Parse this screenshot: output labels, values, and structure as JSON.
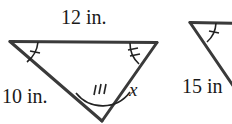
{
  "figure": {
    "stroke_color": "#333333",
    "text_color": "#1a1a1a",
    "background_color": "#ffffff",
    "triangles": [
      {
        "id": "triangle-left",
        "vertices": {
          "top_left": [
            10,
            41
          ],
          "top_right": [
            157,
            42
          ],
          "bottom": [
            102,
            121
          ]
        },
        "side_labels": [
          {
            "name": "top-side-label",
            "text": "12 in."
          },
          {
            "name": "left-side-label",
            "text": "10 in."
          },
          {
            "name": "right-side-label",
            "text": "x"
          }
        ],
        "angle_marks": [
          {
            "vertex": "top-left",
            "ticks": 1
          },
          {
            "vertex": "top-right",
            "ticks": 2
          },
          {
            "vertex": "bottom",
            "ticks": 3
          }
        ]
      },
      {
        "id": "triangle-right",
        "clipped": "true",
        "vertices": {
          "top_left": [
            190,
            22
          ],
          "top_right": [
            252,
            23
          ],
          "bottom": [
            236,
            90
          ]
        },
        "side_labels": [
          {
            "name": "left-side-label",
            "text": "15 in"
          }
        ],
        "angle_marks": [
          {
            "vertex": "top-left",
            "ticks": 1
          }
        ]
      }
    ]
  }
}
